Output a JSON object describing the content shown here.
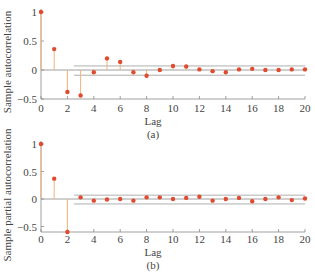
{
  "colors": {
    "marker": "#e04a2e",
    "stem": "#f2b27a",
    "axis": "#888888",
    "band": "#9a9a9a",
    "text": "#444444"
  },
  "chart_data": [
    {
      "type": "stem",
      "title": "",
      "caption": "(a)",
      "xlabel": "Lag",
      "ylabel": "Sample autocorrelation",
      "xlim": [
        0,
        20
      ],
      "ylim": [
        -0.5,
        1
      ],
      "xticks": [
        0,
        2,
        4,
        6,
        8,
        10,
        12,
        14,
        16,
        18,
        20
      ],
      "yticks": [
        1,
        0.5,
        0,
        -0.5
      ],
      "ytick_labels": [
        "1",
        "0.5",
        "0",
        "−0.5"
      ],
      "confidence_band": {
        "upper": 0.07,
        "lower": -0.09,
        "from_lag": 2.5
      },
      "x": [
        0,
        1,
        2,
        3,
        4,
        5,
        6,
        7,
        8,
        9,
        10,
        11,
        12,
        13,
        14,
        15,
        16,
        17,
        18,
        19,
        20
      ],
      "values": [
        1.0,
        0.36,
        -0.38,
        -0.44,
        -0.04,
        0.2,
        0.14,
        -0.04,
        -0.1,
        0.0,
        0.07,
        0.06,
        0.01,
        -0.02,
        -0.04,
        0.01,
        0.02,
        0.0,
        0.0,
        0.01,
        0.01
      ]
    },
    {
      "type": "stem",
      "title": "",
      "caption": "(b)",
      "xlabel": "Lag",
      "ylabel": "Sample partial autocorrelation",
      "xlim": [
        0,
        20
      ],
      "ylim": [
        -0.6,
        1
      ],
      "xticks": [
        0,
        2,
        4,
        6,
        8,
        10,
        12,
        14,
        16,
        18,
        20
      ],
      "yticks": [
        1,
        0.5,
        0,
        -0.5
      ],
      "ytick_labels": [
        "1",
        "0.5",
        "0",
        "−0.5"
      ],
      "confidence_band": {
        "upper": 0.07,
        "lower": -0.09,
        "from_lag": 2.5
      },
      "x": [
        0,
        1,
        2,
        3,
        4,
        5,
        6,
        7,
        8,
        9,
        10,
        11,
        12,
        13,
        14,
        15,
        16,
        17,
        18,
        19,
        20
      ],
      "values": [
        1.0,
        0.37,
        -0.6,
        0.03,
        -0.03,
        -0.01,
        0.0,
        -0.03,
        0.03,
        0.03,
        0.0,
        0.02,
        0.04,
        -0.03,
        0.0,
        0.02,
        -0.04,
        0.0,
        0.03,
        -0.02,
        0.01
      ]
    }
  ]
}
